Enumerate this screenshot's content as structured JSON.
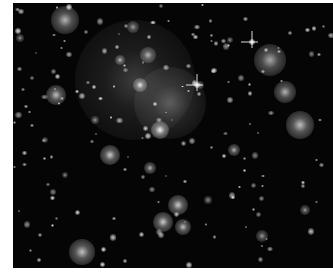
{
  "image": {
    "subject": "galaxy cluster deep field",
    "colors": {
      "background": "#050505",
      "border": "#ffffff",
      "glow": "#e8e8e8"
    },
    "galaxies": [
      {
        "x": 65,
        "y": 20,
        "r": 14,
        "o": 0.7
      },
      {
        "x": 133,
        "y": 27,
        "r": 6,
        "o": 0.6
      },
      {
        "x": 56,
        "y": 95,
        "r": 10,
        "o": 0.75
      },
      {
        "x": 148,
        "y": 55,
        "r": 8,
        "o": 0.7
      },
      {
        "x": 135,
        "y": 80,
        "r": 60,
        "o": 0.22
      },
      {
        "x": 140,
        "y": 85,
        "r": 7,
        "o": 0.9
      },
      {
        "x": 170,
        "y": 103,
        "r": 36,
        "o": 0.3
      },
      {
        "x": 160,
        "y": 130,
        "r": 9,
        "o": 0.95
      },
      {
        "x": 110,
        "y": 155,
        "r": 10,
        "o": 0.8
      },
      {
        "x": 150,
        "y": 168,
        "r": 6,
        "o": 0.7
      },
      {
        "x": 270,
        "y": 60,
        "r": 16,
        "o": 0.65
      },
      {
        "x": 285,
        "y": 92,
        "r": 11,
        "o": 0.7
      },
      {
        "x": 300,
        "y": 125,
        "r": 14,
        "o": 0.75
      },
      {
        "x": 234,
        "y": 150,
        "r": 6,
        "o": 0.7
      },
      {
        "x": 178,
        "y": 205,
        "r": 10,
        "o": 0.8
      },
      {
        "x": 163,
        "y": 222,
        "r": 10,
        "o": 0.8
      },
      {
        "x": 183,
        "y": 227,
        "r": 8,
        "o": 0.75
      },
      {
        "x": 82,
        "y": 252,
        "r": 13,
        "o": 0.75
      },
      {
        "x": 262,
        "y": 236,
        "r": 6,
        "o": 0.6
      },
      {
        "x": 305,
        "y": 210,
        "r": 5,
        "o": 0.6
      },
      {
        "x": 20,
        "y": 38,
        "r": 4,
        "o": 0.6
      },
      {
        "x": 230,
        "y": 40,
        "r": 3,
        "o": 0.6
      },
      {
        "x": 120,
        "y": 60,
        "r": 5,
        "o": 0.7
      },
      {
        "x": 200,
        "y": 85,
        "r": 4,
        "o": 0.6
      },
      {
        "x": 95,
        "y": 120,
        "r": 4,
        "o": 0.6
      },
      {
        "x": 45,
        "y": 140,
        "r": 3,
        "o": 0.6
      },
      {
        "x": 65,
        "y": 175,
        "r": 3,
        "o": 0.6
      },
      {
        "x": 208,
        "y": 200,
        "r": 4,
        "o": 0.6
      }
    ],
    "stars": [
      {
        "x": 252,
        "y": 42
      },
      {
        "x": 197,
        "y": 85
      }
    ]
  }
}
